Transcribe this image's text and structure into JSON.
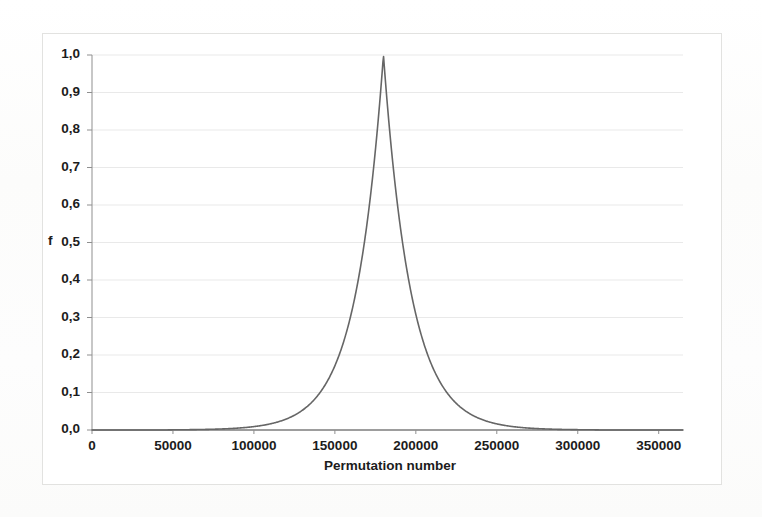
{
  "figure": {
    "frame_border_color": "#e2e2e0",
    "background_color": "#fdfdfc",
    "plot_background_color": "#ffffff"
  },
  "chart_data": {
    "type": "line",
    "title": "",
    "subtitle": "",
    "xlabel": "Permutation number",
    "ylabel": "f",
    "xlim": [
      0,
      365000
    ],
    "ylim": [
      0.0,
      1.0
    ],
    "grid": true,
    "grid_axis": "y",
    "legend": false,
    "legend_position": "none",
    "line_color": "#666666",
    "line_width": 1.6,
    "decimal_separator": ",",
    "x_tick_values": [
      0,
      50000,
      100000,
      150000,
      200000,
      250000,
      300000,
      350000
    ],
    "x_tick_labels": [
      "0",
      "50000",
      "100000",
      "150000",
      "200000",
      "250000",
      "300000",
      "350000"
    ],
    "y_tick_values": [
      0.0,
      0.1,
      0.2,
      0.3,
      0.4,
      0.5,
      0.6,
      0.7,
      0.8,
      0.9,
      1.0
    ],
    "y_tick_labels": [
      "0,0",
      "0,1",
      "0,2",
      "0,3",
      "0,4",
      "0,5",
      "0,6",
      "0,7",
      "0,8",
      "0,9",
      "1,0"
    ],
    "peak": {
      "x": 180000,
      "y": 1.0
    },
    "distribution": {
      "shape": "laplace",
      "mu": 180000,
      "b": 17000
    },
    "series": [
      {
        "name": "f",
        "x": [
          0,
          10000,
          20000,
          30000,
          40000,
          50000,
          60000,
          70000,
          80000,
          90000,
          100000,
          110000,
          115000,
          120000,
          125000,
          130000,
          135000,
          140000,
          145000,
          150000,
          155000,
          158000,
          161000,
          164000,
          167000,
          170000,
          172000,
          174000,
          176000,
          178000,
          180000,
          182000,
          184000,
          186000,
          188000,
          190000,
          193000,
          196000,
          199000,
          202000,
          205000,
          210000,
          215000,
          220000,
          225000,
          230000,
          235000,
          240000,
          245000,
          250000,
          260000,
          270000,
          280000,
          290000,
          300000,
          310000,
          320000,
          330000,
          340000,
          350000,
          360000,
          365000
        ],
        "y": [
          0.0,
          0.0,
          0.0,
          0.0,
          0.001,
          0.001,
          0.001,
          0.002,
          0.004,
          0.006,
          0.009,
          0.017,
          0.022,
          0.03,
          0.04,
          0.054,
          0.073,
          0.098,
          0.131,
          0.175,
          0.234,
          0.278,
          0.331,
          0.394,
          0.468,
          0.557,
          0.626,
          0.703,
          0.79,
          0.888,
          1.0,
          0.888,
          0.79,
          0.703,
          0.626,
          0.557,
          0.468,
          0.394,
          0.331,
          0.278,
          0.234,
          0.175,
          0.131,
          0.098,
          0.073,
          0.054,
          0.04,
          0.03,
          0.022,
          0.017,
          0.009,
          0.006,
          0.004,
          0.002,
          0.001,
          0.001,
          0.001,
          0.0,
          0.0,
          0.0,
          0.0,
          0.0
        ]
      }
    ]
  }
}
